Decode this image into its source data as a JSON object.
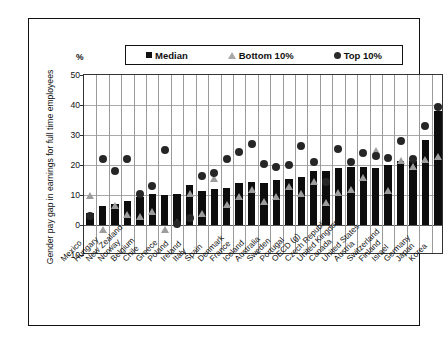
{
  "chart_data": {
    "type": "bar",
    "title": "",
    "xlabel": "",
    "ylabel": "Gender pay gap in earnings for full time employees",
    "unit_label": "%",
    "ylim": [
      -10,
      50
    ],
    "yticks": [
      50,
      40,
      30,
      20,
      10,
      0,
      -10
    ],
    "grid": true,
    "legend_position": "top",
    "categories": [
      "Mexico",
      "Hungary",
      "New Zealand",
      "Norway",
      "Belgium",
      "Chile",
      "Greece",
      "Poland",
      "Ireland",
      "Italy",
      "Spain",
      "Denmark",
      "France",
      "Iceland",
      "Australia",
      "Sweden",
      "Portugal",
      "OECD (g)",
      "Czech Republic",
      "United Kingdom",
      "Canada",
      "United States",
      "Austria",
      "Switzerland",
      "Finland",
      "Israel",
      "Germany",
      "Japan",
      "Korea"
    ],
    "series": [
      {
        "name": "Median",
        "marker": "square",
        "color": "#0d0d0d",
        "values": [
          4.0,
          6.5,
          7.0,
          8.0,
          9.5,
          10.5,
          10.0,
          10.5,
          13.5,
          11.5,
          12.0,
          12.5,
          14.0,
          14.5,
          14.0,
          15.0,
          15.5,
          16.0,
          18.0,
          18.0,
          19.0,
          19.5,
          19.5,
          19.0,
          20.0,
          21.5,
          21.5,
          28.5,
          38.0
        ]
      },
      {
        "name": "Bottom 10%",
        "marker": "triangle",
        "color": "#9d9d9d",
        "values": [
          10.0,
          -1.5,
          6.5,
          3.5,
          3.0,
          4.5,
          -1.5,
          1.0,
          10.5,
          4.0,
          15.5,
          7.0,
          9.5,
          12.0,
          8.0,
          9.5,
          13.0,
          10.5,
          14.5,
          7.5,
          11.0,
          12.0,
          16.0,
          25.0,
          11.5,
          21.5,
          19.5,
          22.0,
          23.0
        ]
      },
      {
        "name": "Top 10%",
        "marker": "circle",
        "color": "#262626",
        "values": [
          3.0,
          22.0,
          18.0,
          22.0,
          10.5,
          13.0,
          25.0,
          0.5,
          2.5,
          16.5,
          17.5,
          22.0,
          24.5,
          27.0,
          20.5,
          19.5,
          20.0,
          26.5,
          21.0,
          14.5,
          25.5,
          21.0,
          24.0,
          23.0,
          22.5,
          28.0,
          22.0,
          33.0,
          39.5
        ]
      }
    ]
  },
  "legend": {
    "items": [
      {
        "label": "Median",
        "marker": "square"
      },
      {
        "label": "Bottom 10%",
        "marker": "triangle"
      },
      {
        "label": "Top 10%",
        "marker": "circle"
      }
    ]
  }
}
